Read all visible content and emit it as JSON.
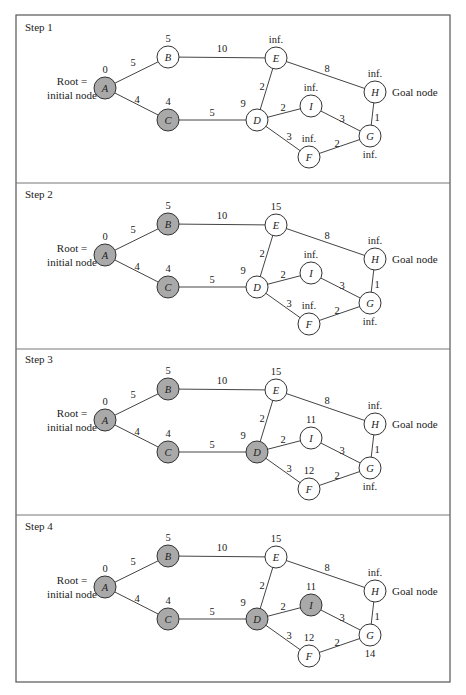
{
  "figure": {
    "frame": {
      "left": 16,
      "right": 450,
      "top": 15,
      "bottom": 682,
      "dividers": [
        183,
        349,
        515
      ]
    },
    "colors": {
      "visited_fill": "#a9a9a9",
      "unvisited_fill": "#ffffff",
      "line": "#444444"
    },
    "node_radius": 11,
    "root_label_line1": "Root =",
    "root_label_line2": "initial node",
    "goal_label": "Goal node",
    "nodes": [
      {
        "id": "A",
        "x": 105,
        "y": 88
      },
      {
        "id": "B",
        "x": 168,
        "y": 57
      },
      {
        "id": "C",
        "x": 168,
        "y": 120
      },
      {
        "id": "E",
        "x": 276,
        "y": 58
      },
      {
        "id": "D",
        "x": 257,
        "y": 120
      },
      {
        "id": "I",
        "x": 311,
        "y": 106
      },
      {
        "id": "H",
        "x": 375,
        "y": 92
      },
      {
        "id": "G",
        "x": 370,
        "y": 136
      },
      {
        "id": "F",
        "x": 309,
        "y": 157
      }
    ],
    "edges": [
      {
        "from": "A",
        "to": "B",
        "weight": "5",
        "lx": 133,
        "ly": 66
      },
      {
        "from": "A",
        "to": "C",
        "weight": "4",
        "lx": 137,
        "ly": 103
      },
      {
        "from": "B",
        "to": "E",
        "weight": "10",
        "lx": 222,
        "ly": 52
      },
      {
        "from": "C",
        "to": "D",
        "weight": "5",
        "lx": 212,
        "ly": 116
      },
      {
        "from": "E",
        "to": "D",
        "weight": "2",
        "lx": 262,
        "ly": 90
      },
      {
        "from": "E",
        "to": "H",
        "weight": "8",
        "lx": 327,
        "ly": 72
      },
      {
        "from": "D",
        "to": "I",
        "weight": "2",
        "lx": 283,
        "ly": 111
      },
      {
        "from": "D",
        "to": "F",
        "weight": "3",
        "lx": 289,
        "ly": 140
      },
      {
        "from": "I",
        "to": "G",
        "weight": "3",
        "lx": 342,
        "ly": 122
      },
      {
        "from": "F",
        "to": "G",
        "weight": "2",
        "lx": 337,
        "ly": 147
      },
      {
        "from": "H",
        "to": "G",
        "weight": "1",
        "lx": 377,
        "ly": 121
      }
    ],
    "dist_label_offsets": {
      "A": [
        0,
        -15
      ],
      "B": [
        0,
        -15
      ],
      "C": [
        0,
        -15
      ],
      "E": [
        0,
        -15
      ],
      "D": [
        -14,
        -13
      ],
      "I": [
        0,
        -15
      ],
      "H": [
        0,
        -15
      ],
      "G": [
        0,
        22
      ],
      "F": [
        0,
        -15
      ]
    }
  },
  "steps": [
    {
      "title": "Step 1",
      "offset_y": 0,
      "visited": [
        "A",
        "C"
      ],
      "distances": {
        "A": "0",
        "B": "5",
        "C": "4",
        "D": "9",
        "E": "inf.",
        "F": "inf.",
        "G": "inf.",
        "H": "inf.",
        "I": "inf."
      }
    },
    {
      "title": "Step 2",
      "offset_y": 167,
      "visited": [
        "A",
        "B",
        "C"
      ],
      "distances": {
        "A": "0",
        "B": "5",
        "C": "4",
        "D": "9",
        "E": "15",
        "F": "inf.",
        "G": "inf.",
        "H": "inf.",
        "I": "inf."
      }
    },
    {
      "title": "Step 3",
      "offset_y": 332,
      "visited": [
        "A",
        "B",
        "C",
        "D"
      ],
      "distances": {
        "A": "0",
        "B": "5",
        "C": "4",
        "D": "9",
        "E": "15",
        "F": "12",
        "G": "inf.",
        "H": "inf.",
        "I": "11"
      }
    },
    {
      "title": "Step 4",
      "offset_y": 499,
      "visited": [
        "A",
        "B",
        "C",
        "D",
        "I"
      ],
      "distances": {
        "A": "0",
        "B": "5",
        "C": "4",
        "D": "9",
        "E": "15",
        "F": "12",
        "G": "14",
        "H": "inf.",
        "I": "11"
      }
    }
  ]
}
